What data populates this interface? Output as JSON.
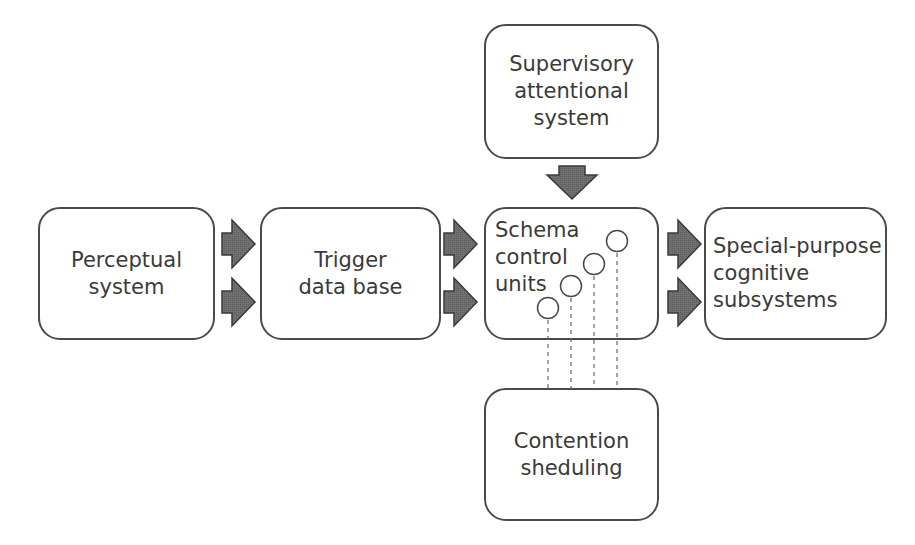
{
  "diagram": {
    "type": "block-diagram",
    "nodes": [
      {
        "id": "perceptual",
        "lines": [
          "Perceptual",
          "system"
        ]
      },
      {
        "id": "trigger",
        "lines": [
          "Trigger",
          "data base"
        ]
      },
      {
        "id": "schema",
        "lines": [
          "Schema",
          "control",
          "units"
        ]
      },
      {
        "id": "special",
        "lines": [
          "Special-purpose",
          "cognitive",
          "subsystems"
        ]
      },
      {
        "id": "supervisory",
        "lines": [
          "Supervisory",
          "attentional",
          "system"
        ]
      },
      {
        "id": "contention",
        "lines": [
          "Contention",
          "sheduling"
        ]
      }
    ],
    "edges": [
      {
        "from": "perceptual",
        "to": "trigger",
        "style": "double-block-arrow"
      },
      {
        "from": "trigger",
        "to": "schema",
        "style": "double-block-arrow"
      },
      {
        "from": "schema",
        "to": "special",
        "style": "double-block-arrow"
      },
      {
        "from": "supervisory",
        "to": "schema",
        "style": "block-arrow-down"
      },
      {
        "from": "schema",
        "to": "contention",
        "style": "dashed-lines",
        "count": 4
      }
    ],
    "schema_units_count": 4
  },
  "colors": {
    "border": "#4a4a4a",
    "text": "#3a3a3a",
    "arrow_fill": "#6e6e6e",
    "arrow_stroke": "#3a3a3a",
    "background": "#ffffff"
  }
}
